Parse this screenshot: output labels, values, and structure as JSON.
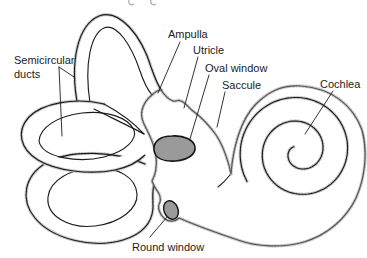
{
  "diagram": {
    "labels": {
      "semicircular_ducts": {
        "line1": "Semicircular",
        "line2": "ducts"
      },
      "ampulla": "Ampulla",
      "utricle": "Utricle",
      "oval_window": "Oval window",
      "saccule": "Saccule",
      "cochlea": "Cochlea",
      "round_window": "Round window"
    }
  },
  "colors": {
    "outline": "#1c1c1c",
    "label_text": "#1c1c1c",
    "window_fill": "#9a9a9a",
    "window_stroke": "#161616",
    "stipple": "#8f8f8f",
    "background": "#ffffff"
  }
}
